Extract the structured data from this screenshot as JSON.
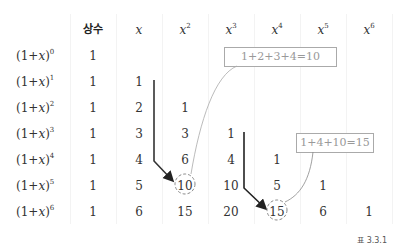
{
  "table": {
    "headers": [
      {
        "base": "상수",
        "exp": "",
        "korean": true
      },
      {
        "base": "x",
        "exp": "",
        "korean": false
      },
      {
        "base": "x",
        "exp": "2",
        "korean": false
      },
      {
        "base": "x",
        "exp": "3",
        "korean": false
      },
      {
        "base": "x",
        "exp": "4",
        "korean": false
      },
      {
        "base": "x",
        "exp": "5",
        "korean": false
      },
      {
        "base": "x",
        "exp": "6",
        "korean": false
      }
    ],
    "rows": [
      {
        "label": "(1+x)",
        "exp": "0",
        "values": [
          "1",
          "",
          "",
          "",
          "",
          "",
          ""
        ]
      },
      {
        "label": "(1+x)",
        "exp": "1",
        "values": [
          "1",
          "1",
          "",
          "",
          "",
          "",
          ""
        ]
      },
      {
        "label": "(1+x)",
        "exp": "2",
        "values": [
          "1",
          "2",
          "1",
          "",
          "",
          "",
          ""
        ]
      },
      {
        "label": "(1+x)",
        "exp": "3",
        "values": [
          "1",
          "3",
          "3",
          "1",
          "",
          "",
          ""
        ]
      },
      {
        "label": "(1+x)",
        "exp": "4",
        "values": [
          "1",
          "4",
          "6",
          "4",
          "1",
          "",
          ""
        ]
      },
      {
        "label": "(1+x)",
        "exp": "5",
        "values": [
          "1",
          "5",
          "10",
          "10",
          "5",
          "1",
          ""
        ]
      },
      {
        "label": "(1+x)",
        "exp": "6",
        "values": [
          "1",
          "6",
          "15",
          "20",
          "15",
          "6",
          "1"
        ]
      }
    ]
  },
  "annotations": {
    "note1": "1+2+3+4=10",
    "note2": "1+4+10=15"
  },
  "highlighted_cells": [
    {
      "row": 5,
      "col": 2,
      "value": "10"
    },
    {
      "row": 6,
      "col": 4,
      "value": "15"
    }
  ],
  "caption": "표 3.3.1"
}
